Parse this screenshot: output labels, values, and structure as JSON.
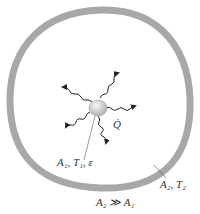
{
  "diagram": {
    "colors": {
      "enclosure": "#a8a8a8",
      "body": "#d6d6d6",
      "arrows": "#222222",
      "text": "#333333"
    },
    "labels": {
      "heat_rate": "Q̇",
      "small_body": "A₁, T₁, ε",
      "enclosure": "A₂, T₂",
      "condition": "A₂ ≫ A₁"
    }
  }
}
